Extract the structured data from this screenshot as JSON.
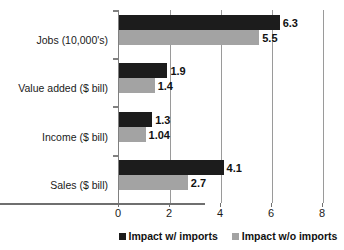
{
  "chart_data": {
    "type": "bar",
    "orientation": "horizontal",
    "title": "",
    "xlabel": "",
    "ylabel": "",
    "xlim": [
      0,
      8
    ],
    "xticks": [
      "0",
      "2",
      "4",
      "6",
      "8"
    ],
    "grid": true,
    "legend_position": "bottom",
    "categories": [
      "Jobs (10,000's)",
      "Value added ($ bill)",
      "Income ($ bill)",
      "Sales ($ bill)"
    ],
    "series": [
      {
        "name": "Impact w/ imports",
        "color": "#1c1c1c",
        "values": [
          6.3,
          1.9,
          1.3,
          4.1
        ],
        "labels": [
          "6.3",
          "1.9",
          "1.3",
          "4.1"
        ]
      },
      {
        "name": "Impact w/o imports",
        "color": "#a3a3a3",
        "values": [
          5.5,
          1.4,
          1.04,
          2.7
        ],
        "labels": [
          "5.5",
          "1.4",
          "1.04",
          "2.7"
        ]
      }
    ]
  },
  "legend": {
    "items": [
      {
        "label": "Impact w/ imports",
        "swatch": "legend-swatch-dark"
      },
      {
        "label": "Impact w/o imports",
        "swatch": "legend-swatch-light"
      }
    ]
  }
}
